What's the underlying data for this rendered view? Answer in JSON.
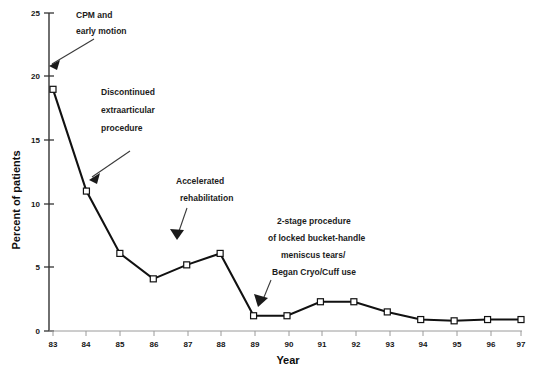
{
  "chart_data": {
    "type": "line",
    "title": "",
    "xlabel": "Year",
    "ylabel": "Percent of patients",
    "categories": [
      "83",
      "84",
      "85",
      "86",
      "87",
      "88",
      "89",
      "90",
      "91",
      "92",
      "93",
      "94",
      "95",
      "96",
      "97"
    ],
    "values": [
      19.0,
      11.0,
      6.1,
      4.1,
      5.2,
      6.1,
      1.2,
      1.2,
      2.3,
      2.3,
      1.5,
      0.9,
      0.8,
      0.9,
      0.9
    ],
    "series": [
      {
        "name": "Percent of patients",
        "values": [
          19.0,
          11.0,
          6.1,
          4.1,
          5.2,
          6.1,
          1.2,
          1.2,
          2.3,
          2.3,
          1.5,
          0.9,
          0.8,
          0.9,
          0.9
        ]
      }
    ],
    "ylim": [
      0,
      25
    ],
    "yticks": [
      0,
      5,
      10,
      15,
      20,
      25
    ],
    "ytick_labels": [
      "0",
      "5",
      "10",
      "15",
      "20",
      "25"
    ],
    "xtick_labels": [
      "83",
      "84",
      "85",
      "86",
      "87",
      "88",
      "89",
      "90",
      "91",
      "92",
      "93",
      "94",
      "95",
      "96",
      "97"
    ],
    "grid": false,
    "legend": "none",
    "marker": "open-square",
    "line_color": "#111111",
    "marker_fill": "#ffffff",
    "annotations": [
      {
        "id": "annotation-cpm-early-motion",
        "lines": [
          "CPM and",
          "early motion"
        ],
        "target_year": "83"
      },
      {
        "id": "annotation-discontinued-extraarticular",
        "lines": [
          "Discontinued",
          "extraarticular",
          "procedure"
        ],
        "target_year": "84"
      },
      {
        "id": "annotation-accelerated-rehabilitation",
        "lines": [
          "Accelerated",
          "rehabilitation"
        ],
        "target_year": "87"
      },
      {
        "id": "annotation-two-stage-procedure",
        "lines": [
          "2-stage procedure",
          "of locked bucket-handle",
          "meniscus tears/",
          "Began Cryo/Cuff use"
        ],
        "target_year": "89"
      }
    ]
  }
}
